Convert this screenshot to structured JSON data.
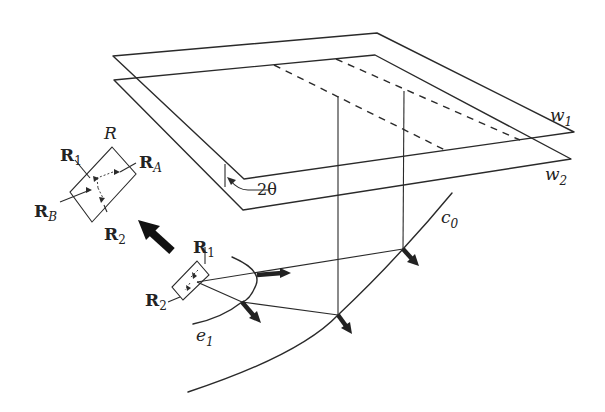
{
  "figure": {
    "type": "diagram",
    "colors": {
      "stroke": "#2a2a2a",
      "text": "#222222",
      "background": "#ffffff"
    }
  },
  "labels": {
    "w1": {
      "main": "w",
      "sub": "1"
    },
    "w2": {
      "main": "w",
      "sub": "2"
    },
    "angle": "2θ",
    "c0": {
      "main": "c",
      "sub": "0"
    },
    "e1": {
      "main": "e",
      "sub": "1"
    },
    "R": "R",
    "R1_large": {
      "main": "R",
      "sub": "1"
    },
    "R2_large": {
      "main": "R",
      "sub": "2"
    },
    "RA": {
      "main": "R",
      "sub": "A"
    },
    "RB": {
      "main": "R",
      "sub": "B"
    },
    "R1_small": {
      "main": "R",
      "sub": "1"
    },
    "R2_small": {
      "main": "R",
      "sub": "2"
    }
  }
}
